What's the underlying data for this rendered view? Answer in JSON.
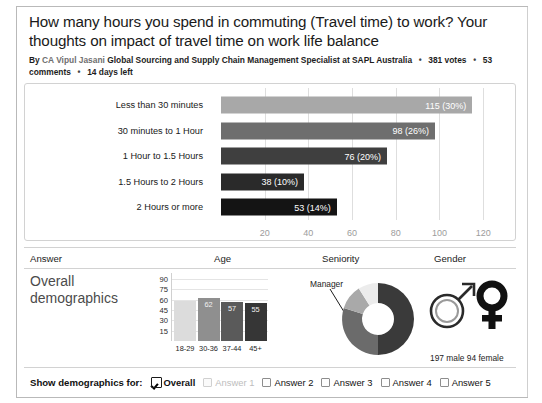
{
  "poll": {
    "title": "How many hours you spend in commuting (Travel time) to work? Your thoughts on impact of travel time on work life balance",
    "byline_prefix": "By",
    "author": "CA Vipul Jasani",
    "author_title": "Global Sourcing and Supply Chain Management Specialist at SAPL Australia",
    "votes": "381 votes",
    "comments": "53 comments",
    "days_left": "14 days left"
  },
  "chart_data": {
    "type": "bar",
    "orientation": "horizontal",
    "title": "",
    "xlabel": "",
    "ylabel": "",
    "xlim": [
      0,
      130
    ],
    "grid": true,
    "categories": [
      "Less than 30 minutes",
      "30 minutes to 1 Hour",
      "1 Hour to 1.5 Hours",
      "1.5 Hours to 2 Hours",
      "2 Hours or more"
    ],
    "values": [
      115,
      98,
      76,
      38,
      53
    ],
    "percents": [
      "30%",
      "26%",
      "20%",
      "10%",
      "14%"
    ],
    "value_labels": [
      "115 (30%)",
      "98 (26%)",
      "76 (20%)",
      "38 (10%)",
      "53 (14%)"
    ],
    "bar_colors": [
      "#a8a8a8",
      "#6e6e6e",
      "#3f3f3f",
      "#2a2a2a",
      "#141414"
    ],
    "xticks": [
      20,
      40,
      60,
      80,
      100,
      120
    ],
    "xtick_labels": [
      "20",
      "40",
      "60",
      "80",
      "100",
      "120"
    ]
  },
  "demographics": {
    "columns": [
      "Answer",
      "Age",
      "Seniority",
      "Gender"
    ],
    "overall_label": "Overall demographics",
    "age_chart": {
      "type": "bar",
      "categories": [
        "18-29",
        "30-36",
        "37-44",
        "45+"
      ],
      "values": [
        58,
        62,
        57,
        55
      ],
      "value_labels": [
        "",
        "62",
        "57",
        "55"
      ],
      "bar_colors": [
        "#dcdcdc",
        "#8f8f8f",
        "#5a5a5a",
        "#363636"
      ],
      "yticks": [
        15,
        30,
        45,
        60,
        75,
        90
      ],
      "ytick_labels": [
        "15",
        "30",
        "45",
        "60",
        "75",
        "90"
      ],
      "ylim": [
        0,
        90
      ]
    },
    "seniority_chart": {
      "type": "pie",
      "donut": true,
      "annotation": "Manager",
      "slices": [
        {
          "label": "",
          "value": 50,
          "color": "#3a3a3a"
        },
        {
          "label": "Manager",
          "value": 33,
          "color": "#6b6b6b"
        },
        {
          "label": "",
          "value": 11,
          "color": "#a9a9a9"
        },
        {
          "label": "",
          "value": 6,
          "color": "#ececec"
        }
      ]
    },
    "gender": {
      "male_icon": "male-symbol",
      "female_icon": "female-symbol",
      "caption": "197 male  94 female",
      "male_count": "197 male",
      "female_count": "94 female"
    }
  },
  "footer": {
    "label": "Show demographics for:",
    "options": [
      {
        "label": "Overall",
        "checked": true,
        "disabled": false
      },
      {
        "label": "Answer 1",
        "checked": false,
        "disabled": true
      },
      {
        "label": "Answer 2",
        "checked": false,
        "disabled": false
      },
      {
        "label": "Answer 3",
        "checked": false,
        "disabled": false
      },
      {
        "label": "Answer 4",
        "checked": false,
        "disabled": false
      },
      {
        "label": "Answer 5",
        "checked": false,
        "disabled": false
      }
    ]
  }
}
